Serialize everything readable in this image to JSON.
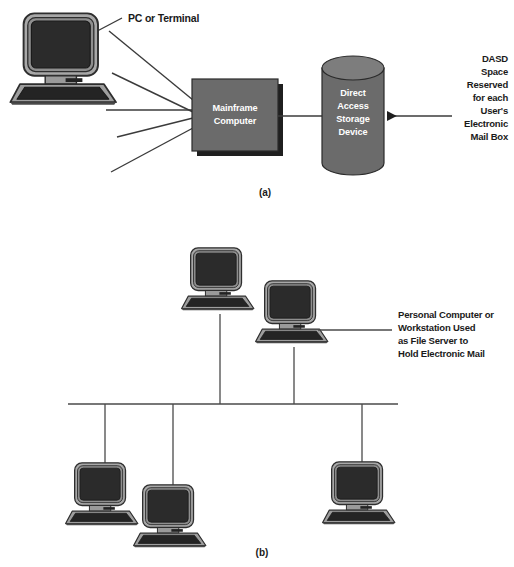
{
  "figure": {
    "caption_a": "(a)",
    "caption_b": "(b)"
  },
  "colors": {
    "node_fill": "#6b6b6b",
    "node_shadow": "#1f1f1f",
    "cylinder_fill": "#6b6b6b",
    "cylinder_top": "#7a7a7a",
    "screen": "#2b2b2b",
    "case": "#9a9a9a",
    "line": "#3b3b3b",
    "text": "#1a1a1a",
    "node_text": "#ffffff",
    "background": "#ffffff"
  },
  "panel_a": {
    "terminal_label": "PC or Terminal",
    "mainframe": {
      "line1": "Mainframe",
      "line2": "Computer"
    },
    "dasd": {
      "line1": "Direct",
      "line2": "Access",
      "line3": "Storage",
      "line4": "Device"
    },
    "callout": [
      "DASD",
      "Space",
      "Reserved",
      "for each",
      "User's",
      "Electronic",
      "Mail Box"
    ],
    "terminal_count": 5
  },
  "panel_b": {
    "server_callout": [
      "Personal Computer or",
      "Workstation Used",
      "as File Server to",
      "Hold Electronic Mail"
    ],
    "workstation_count": 6,
    "topology": "bus"
  }
}
